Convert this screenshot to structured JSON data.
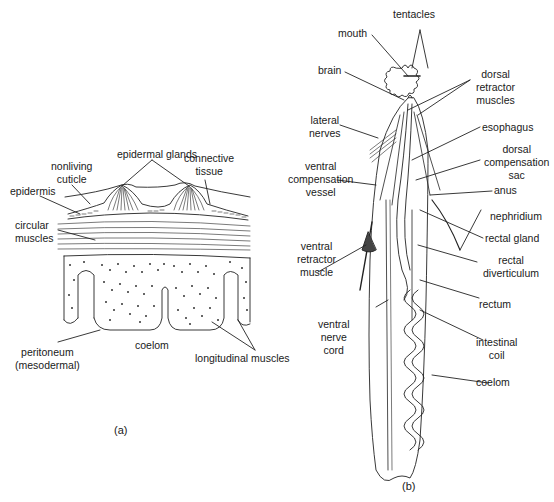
{
  "figure_a": {
    "caption": "(a)",
    "labels": {
      "epidermal_glands": "epidermal glands",
      "nonliving_cuticle": "nonliving\ncuticle",
      "connective_tissue": "connective\ntissue",
      "epidermis": "epidermis",
      "circular_muscles": "circular\nmuscles",
      "peritoneum": "peritoneum\n(mesodermal)",
      "coelom": "coelom",
      "longitudinal_muscles": "longitudinal muscles"
    }
  },
  "figure_b": {
    "caption": "(b)",
    "labels": {
      "tentacles": "tentacles",
      "mouth": "mouth",
      "brain": "brain",
      "dorsal_retractor_muscles": "dorsal\nretractor\nmuscles",
      "lateral_nerves": "lateral\nnerves",
      "esophagus": "esophagus",
      "ventral_compensation_vessel": "ventral\ncompensation\nvessel",
      "dorsal_compensation_sac": "dorsal\ncompensation\nsac",
      "anus": "anus",
      "nephridium": "nephridium",
      "ventral_retractor_muscle": "ventral\nretractor\nmuscle",
      "rectal_gland": "rectal gland",
      "rectal_diverticulum": "rectal\ndiverticulum",
      "rectum": "rectum",
      "ventral_nerve_cord": "ventral\nnerve\ncord",
      "intestinal_coil": "intestinal\ncoil",
      "coelom": "coelom"
    }
  }
}
